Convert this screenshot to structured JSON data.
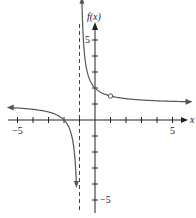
{
  "chart_data": {
    "type": "line",
    "title": "",
    "xlabel": "x",
    "ylabel": "f(x)",
    "xlim": [
      -5.5,
      6.2
    ],
    "ylim": [
      -5.5,
      6.5
    ],
    "x_ticks": [
      -5,
      -4,
      -3,
      -2,
      -1,
      0,
      1,
      2,
      3,
      4,
      5
    ],
    "y_ticks": [
      -5,
      -4,
      -3,
      -2,
      -1,
      0,
      1,
      2,
      3,
      4,
      5
    ],
    "x_tick_labels": {
      "-5": "−5",
      "5": "5"
    },
    "y_tick_labels": {
      "5": "5",
      "-5": "−5"
    },
    "grid": false,
    "function": "f(x) = (x+2)/(x+1)",
    "vertical_asymptote": -1,
    "horizontal_asymptote": 1,
    "key_points": [
      {
        "x": -2,
        "y": 0,
        "note": "x-intercept"
      },
      {
        "x": 0,
        "y": 2,
        "note": "y-intercept"
      },
      {
        "x": 1,
        "y": 1.5,
        "note": "hole (open circle)"
      }
    ],
    "series": [
      {
        "name": "left branch",
        "x": [
          -5.5,
          -5,
          -4,
          -3,
          -2.5,
          -2,
          -1.5,
          -1.25,
          -1.2
        ],
        "y": [
          0.78,
          0.75,
          0.67,
          0.5,
          0.33,
          0,
          -1,
          -3,
          -4
        ]
      },
      {
        "name": "right branch",
        "x": [
          -0.84,
          -0.8,
          -0.5,
          0,
          0.5,
          1,
          2,
          3,
          4,
          5,
          6
        ],
        "y": [
          7.25,
          6,
          3,
          2,
          1.67,
          1.5,
          1.33,
          1.25,
          1.2,
          1.17,
          1.14
        ]
      }
    ],
    "colors": {
      "curve": "#555555",
      "axes": "#222222",
      "asymptote": "#444444"
    }
  }
}
